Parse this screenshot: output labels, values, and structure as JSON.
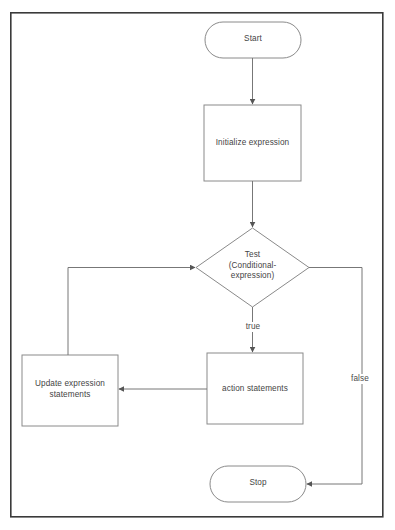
{
  "diagram": {
    "type": "flowchart",
    "canvas": {
      "width": 395,
      "height": 530,
      "background": "#ffffff"
    },
    "frame": {
      "name": "outer-border",
      "x": 10,
      "y": 12,
      "width": 373,
      "height": 505,
      "stroke": "#3a3a3a",
      "stroke_width": 1.6,
      "fill": "#ffffff"
    },
    "style": {
      "node_stroke": "#8a8a8a",
      "node_fill": "#ffffff",
      "edge_stroke": "#777777",
      "text_color": "#444444"
    },
    "nodes": [
      {
        "id": "start",
        "shape": "terminator",
        "label": "Start",
        "x": 205,
        "y": 22,
        "width": 96,
        "height": 36
      },
      {
        "id": "initialize",
        "shape": "process",
        "label": "Initialize expression",
        "x": 204,
        "y": 105,
        "width": 97,
        "height": 76
      },
      {
        "id": "test",
        "shape": "decision",
        "label": "Test\n(Conditional-\nexpression)",
        "x": 196,
        "y": 228,
        "width": 113,
        "height": 79
      },
      {
        "id": "action",
        "shape": "process",
        "label": "action statements",
        "x": 207,
        "y": 353,
        "width": 96,
        "height": 71
      },
      {
        "id": "update",
        "shape": "process",
        "label": "Update expression\nstatements",
        "x": 22,
        "y": 355,
        "width": 96,
        "height": 71
      },
      {
        "id": "stop",
        "shape": "terminator",
        "label": "Stop",
        "x": 210,
        "y": 466,
        "width": 96,
        "height": 36
      }
    ],
    "edges": [
      {
        "id": "start-to-initialize",
        "from": "start",
        "to": "initialize",
        "label": ""
      },
      {
        "id": "initialize-to-test",
        "from": "initialize",
        "to": "test",
        "label": ""
      },
      {
        "id": "test-to-action",
        "from": "test",
        "to": "action",
        "label": "true"
      },
      {
        "id": "action-to-update",
        "from": "action",
        "to": "update",
        "label": ""
      },
      {
        "id": "update-to-test",
        "from": "update",
        "to": "test",
        "label": ""
      },
      {
        "id": "test-to-stop",
        "from": "test",
        "to": "stop",
        "label": "false"
      }
    ],
    "edge_labels": [
      {
        "id": "true-label",
        "text": "true",
        "x": 240,
        "y": 322,
        "width": 26
      },
      {
        "id": "false-label",
        "text": "false",
        "x": 346,
        "y": 374,
        "width": 28
      }
    ]
  }
}
